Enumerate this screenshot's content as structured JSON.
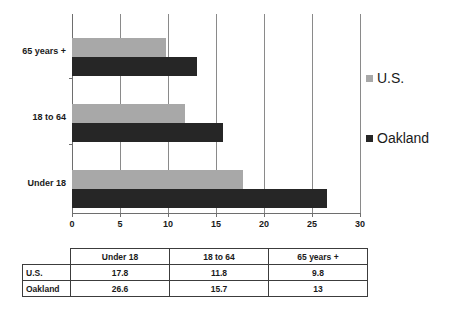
{
  "chart_data": {
    "type": "bar",
    "orientation": "horizontal",
    "title": "",
    "xlabel": "",
    "ylabel": "",
    "xlim": [
      0,
      30
    ],
    "xticks": [
      0,
      5,
      10,
      15,
      20,
      25,
      30
    ],
    "xtick_labels": [
      "0",
      "5",
      "10",
      "15",
      "20",
      "25",
      "30"
    ],
    "grid": true,
    "grid_axis": "x",
    "legend_position": "right",
    "categories": [
      "Under 18",
      "18 to 64",
      "65 years +"
    ],
    "category_order_top_to_bottom": [
      "65 years +",
      "18 to 64",
      "Under 18"
    ],
    "series": [
      {
        "name": "U.S.",
        "color": "#a8a8a8",
        "values": [
          17.8,
          11.8,
          9.8
        ]
      },
      {
        "name": "Oakland",
        "color": "#262626",
        "values": [
          26.6,
          15.7,
          13
        ]
      }
    ]
  },
  "chart": {
    "axis": {
      "ticks": [
        {
          "value": 0,
          "label": "0"
        },
        {
          "value": 5,
          "label": "5"
        },
        {
          "value": 10,
          "label": "10"
        },
        {
          "value": 15,
          "label": "15"
        },
        {
          "value": 20,
          "label": "20"
        },
        {
          "value": 25,
          "label": "25"
        },
        {
          "value": 30,
          "label": "30"
        }
      ]
    },
    "groups": [
      {
        "label": "65 years +",
        "us": 9.8,
        "oakland": 13
      },
      {
        "label": "18 to 64",
        "us": 11.8,
        "oakland": 15.7
      },
      {
        "label": "Under 18",
        "us": 17.8,
        "oakland": 26.6
      }
    ]
  },
  "legend": {
    "items": [
      {
        "label": "U.S.",
        "color": "#a8a8a8"
      },
      {
        "label": "Oakland",
        "color": "#262626"
      }
    ]
  },
  "table": {
    "corner": "",
    "columns": [
      "Under 18",
      "18 to 64",
      "65 years +"
    ],
    "rows": [
      {
        "label": "U.S.",
        "cells": [
          "17.8",
          "11.8",
          "9.8"
        ]
      },
      {
        "label": "Oakland",
        "cells": [
          "26.6",
          "15.7",
          "13"
        ]
      }
    ]
  },
  "colors": {
    "us_bar": "#a8a8a8",
    "oakland_bar": "#262626",
    "gridline": "#8a8a8a",
    "axis": "#6e6e6e",
    "table_border": "#3c3c3c",
    "text": "#1a1a1a",
    "background": "#ffffff"
  }
}
